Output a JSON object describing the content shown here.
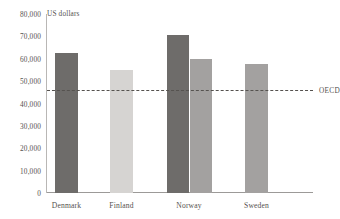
{
  "chart_data": {
    "type": "bar",
    "title": "",
    "subtitle": "",
    "unit_label": "US dollars",
    "xlabel": "",
    "ylabel": "",
    "ylim": [
      0,
      80000
    ],
    "grid": false,
    "legend_position": "none",
    "categories": [
      "Denmark",
      "Finland",
      "Norway",
      "Sweden"
    ],
    "y_ticks": [
      {
        "value": 80000,
        "label": "80,000"
      },
      {
        "value": 70000,
        "label": "70,000"
      },
      {
        "value": 60000,
        "label": "60,000"
      },
      {
        "value": 50000,
        "label": "50,000"
      },
      {
        "value": 40000,
        "label": "40,000"
      },
      {
        "value": 30000,
        "label": "30,000"
      },
      {
        "value": 20000,
        "label": "20,000"
      },
      {
        "value": 10000,
        "label": "10,000"
      },
      {
        "value": 0,
        "label": "0"
      }
    ],
    "bars": [
      {
        "category": "Denmark",
        "value": 62500,
        "color": "#6e6c6a",
        "x": 8,
        "width": 23
      },
      {
        "category": "Finland",
        "value": 55000,
        "color": "#d6d4d2",
        "x": 63,
        "width": 23
      },
      {
        "category": "Norway",
        "value": 70500,
        "color": "#6e6c6a",
        "x": 120,
        "width": 22
      },
      {
        "category": "Norway",
        "value": 60000,
        "color": "#a3a1a0",
        "x": 143,
        "width": 22
      },
      {
        "category": "Sweden",
        "value": 57500,
        "color": "#a3a1a0",
        "x": 198,
        "width": 23
      }
    ],
    "category_positions": [
      19.5,
      74.5,
      142,
      209.5
    ],
    "reference_line": {
      "label": "OECD",
      "value": 46000,
      "color": "#55524f",
      "style": "dashed"
    }
  }
}
